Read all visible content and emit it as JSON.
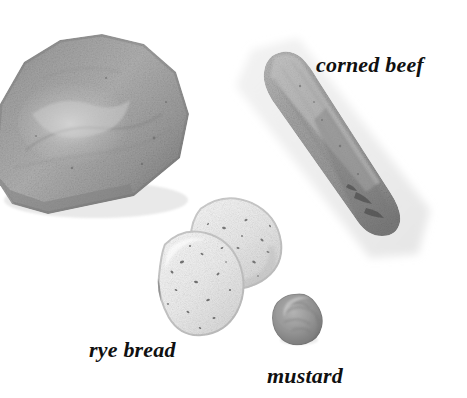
{
  "scene": {
    "title": "Sandwich ingredients photographic diagram",
    "background_color": "#ffffff",
    "width": 467,
    "height": 398
  },
  "labels": [
    {
      "id": "corned-beef",
      "text": "corned beef",
      "style": "bold-italic-serif",
      "color": "#101010",
      "font_size_px": 22,
      "x": 316,
      "y": 54
    },
    {
      "id": "rye-bread",
      "text": "rye bread",
      "style": "bold-italic-serif",
      "color": "#101010",
      "font_size_px": 22,
      "x": 89,
      "y": 339
    },
    {
      "id": "mustard",
      "text": "mustard",
      "style": "bold-italic-serif",
      "color": "#101010",
      "font_size_px": 22,
      "x": 267,
      "y": 365
    }
  ],
  "objects": [
    {
      "id": "rye-loaf",
      "name": "rye bread loaf",
      "description": "whole domed loaf of rye bread, tilted, cropped at left edge",
      "base_color": "#9b9b9b",
      "highlight_color": "#c9c9c9",
      "shadow_color": "#6f6f6f",
      "x": -16,
      "y": 18,
      "width": 230,
      "height": 200
    },
    {
      "id": "corned-beef",
      "name": "corned beef slab",
      "description": "elongated diagonal strip of corned beef with pale halo",
      "base_color": "#a6a6a6",
      "highlight_color": "#d2d2d2",
      "shadow_color": "#6a6a6a",
      "x": 230,
      "y": 42,
      "width": 216,
      "height": 220
    },
    {
      "id": "rye-slices",
      "name": "rye bread slices",
      "description": "two overlapping pale bread slices with dark seed speckles",
      "base_color": "#e9e9e9",
      "highlight_color": "#f7f7f7",
      "shadow_color": "#b4b4b4",
      "speck_color": "#5c5c5c",
      "x": 142,
      "y": 186,
      "width": 150,
      "height": 152
    },
    {
      "id": "mustard-blob",
      "name": "mustard dollop",
      "description": "small round blob of mustard",
      "base_color": "#9d9d9d",
      "highlight_color": "#c4c4c4",
      "shadow_color": "#6d6d6d",
      "x": 268,
      "y": 288,
      "width": 62,
      "height": 62
    }
  ]
}
